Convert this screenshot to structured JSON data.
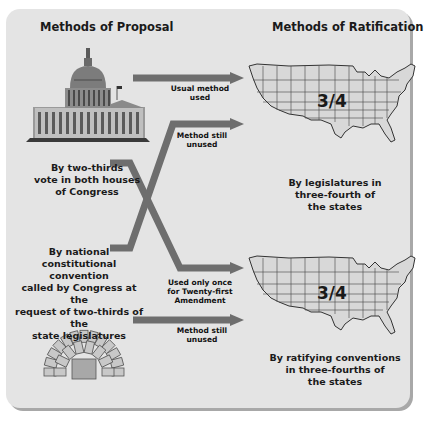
{
  "headings": {
    "proposal": "Methods of Proposal",
    "ratification": "Methods of Ratification"
  },
  "proposal_methods": [
    {
      "text_lines": [
        "By two-thirds",
        "vote in both houses",
        "of Congress"
      ]
    },
    {
      "text_lines": [
        "By national",
        "constitutional convention",
        "called by Congress at the",
        "request of two-thirds of the",
        "state legislatures"
      ]
    }
  ],
  "ratification_methods": [
    {
      "fraction": "3/4",
      "text_lines": [
        "By legislatures in",
        "three-fourth of",
        "the states"
      ]
    },
    {
      "fraction": "3/4",
      "text_lines": [
        "By ratifying conventions",
        "in three-fourths of",
        "the states"
      ]
    }
  ],
  "arrow_labels": [
    {
      "lines": [
        "Usual method",
        "used"
      ]
    },
    {
      "lines": [
        "Method still",
        "unused"
      ]
    },
    {
      "lines": [
        "Used only once",
        "for Twenty-first",
        "Amendment"
      ]
    },
    {
      "lines": [
        "Method still",
        "unused"
      ]
    }
  ],
  "colors": {
    "panel": "#e4e4e4",
    "arrow": "#6e6e6e",
    "map_fill": "#d8d8d8",
    "text": "#1a1a1a"
  }
}
